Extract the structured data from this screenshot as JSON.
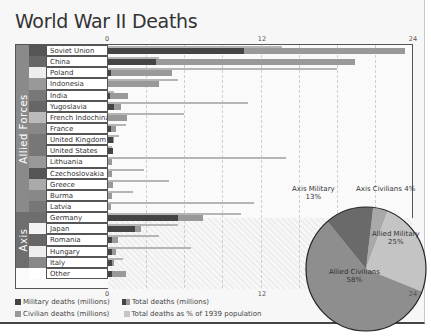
{
  "title": "World War II Deaths",
  "axis": {
    "ticks": [
      "0",
      "12",
      "24"
    ]
  },
  "groups": [
    {
      "label": "Allied Forces",
      "color": "#8a8a8a"
    },
    {
      "label": "Axis",
      "color": "#6e6e6e"
    }
  ],
  "legend": {
    "military": "Military deaths (millions)",
    "total": "Total deaths (millions)",
    "civilian": "Civilian deaths (millions)",
    "pct": "Total deaths as % of 1939 population"
  },
  "pie": {
    "slices": [
      {
        "label": "Axis Civilians",
        "pct": "4%",
        "value": 4,
        "color": "#a9a9a9"
      },
      {
        "label": "Allied Military",
        "pct": "25%",
        "value": 25,
        "color": "#c4c4c4"
      },
      {
        "label": "Allied Civilians",
        "pct": "58%",
        "value": 58,
        "color": "#8e8e8e"
      },
      {
        "label": "Axis Military",
        "pct": "13%",
        "value": 13,
        "color": "#6a6a6a"
      }
    ]
  },
  "rows": [
    {
      "name": "Soviet Union",
      "group": "Allied Forces",
      "military": 10.7,
      "total": 23.4,
      "pct": 13.7
    },
    {
      "name": "China",
      "group": "Allied Forces",
      "military": 3.8,
      "total": 19.4,
      "pct": 4.0
    },
    {
      "name": "Poland",
      "group": "Allied Forces",
      "military": 0.2,
      "total": 5.0,
      "pct": 18.0
    },
    {
      "name": "Indonesia",
      "group": "Allied Forces",
      "military": 0,
      "total": 4.0,
      "pct": 5.5
    },
    {
      "name": "India",
      "group": "Allied Forces",
      "military": 0.1,
      "total": 1.6,
      "pct": 0.5
    },
    {
      "name": "Yugoslavia",
      "group": "Allied Forces",
      "military": 0.5,
      "total": 1.0,
      "pct": 11.0
    },
    {
      "name": "French Indochina",
      "group": "Allied Forces",
      "military": 0,
      "total": 1.5,
      "pct": 6.0
    },
    {
      "name": "France",
      "group": "Allied Forces",
      "military": 0.2,
      "total": 0.6,
      "pct": 1.4
    },
    {
      "name": "United Kingdom",
      "group": "Allied Forces",
      "military": 0.4,
      "total": 0.5,
      "pct": 0.9
    },
    {
      "name": "United States",
      "group": "Allied Forces",
      "military": 0.4,
      "total": 0.4,
      "pct": 0.3
    },
    {
      "name": "Lithuania",
      "group": "Allied Forces",
      "military": 0,
      "total": 0.3,
      "pct": 14.0
    },
    {
      "name": "Czechoslovakia",
      "group": "Allied Forces",
      "military": 0,
      "total": 0.3,
      "pct": 2.8
    },
    {
      "name": "Greece",
      "group": "Allied Forces",
      "military": 0,
      "total": 0.4,
      "pct": 4.8
    },
    {
      "name": "Burma",
      "group": "Allied Forces",
      "military": 0,
      "total": 0.3,
      "pct": 2.0
    },
    {
      "name": "Latvia",
      "group": "Allied Forces",
      "military": 0,
      "total": 0.2,
      "pct": 11.5
    },
    {
      "name": "Germany",
      "group": "Axis",
      "military": 5.5,
      "total": 7.5,
      "pct": 10.5
    },
    {
      "name": "Japan",
      "group": "Axis",
      "military": 2.1,
      "total": 2.6,
      "pct": 5.5
    },
    {
      "name": "Romania",
      "group": "Axis",
      "military": 0.3,
      "total": 0.8,
      "pct": 4.0
    },
    {
      "name": "Hungary",
      "group": "Axis",
      "military": 0.3,
      "total": 0.6,
      "pct": 6.5
    },
    {
      "name": "Italy",
      "group": "Axis",
      "military": 0.3,
      "total": 0.5,
      "pct": 1.2
    },
    {
      "name": "Other",
      "group": "",
      "military": 0.3,
      "total": 1.4,
      "pct": 0
    }
  ],
  "chart_data": [
    {
      "type": "bar",
      "title": "World War II Deaths",
      "orientation": "horizontal",
      "categories": [
        "Soviet Union",
        "China",
        "Poland",
        "Indonesia",
        "India",
        "Yugoslavia",
        "French Indochina",
        "France",
        "United Kingdom",
        "United States",
        "Lithuania",
        "Czechoslovakia",
        "Greece",
        "Burma",
        "Latvia",
        "Germany",
        "Japan",
        "Romania",
        "Hungary",
        "Italy",
        "Other"
      ],
      "series": [
        {
          "name": "Military deaths (millions)",
          "values": [
            10.7,
            3.8,
            0.2,
            0,
            0.1,
            0.5,
            0,
            0.2,
            0.4,
            0.4,
            0,
            0,
            0,
            0,
            0,
            5.5,
            2.1,
            0.3,
            0.3,
            0.3,
            0.3
          ]
        },
        {
          "name": "Total deaths (millions)",
          "values": [
            23.4,
            19.4,
            5.0,
            4.0,
            1.6,
            1.0,
            1.5,
            0.6,
            0.5,
            0.4,
            0.3,
            0.3,
            0.4,
            0.3,
            0.2,
            7.5,
            2.6,
            0.8,
            0.6,
            0.5,
            1.4
          ]
        },
        {
          "name": "Total deaths as % of 1939 population",
          "values": [
            13.7,
            4.0,
            18.0,
            5.5,
            0.5,
            11.0,
            6.0,
            1.4,
            0.9,
            0.3,
            14.0,
            2.8,
            4.8,
            2.0,
            11.5,
            10.5,
            5.5,
            4.0,
            6.5,
            1.2,
            0
          ]
        }
      ],
      "group_labels": [
        "Allied Forces",
        "Axis"
      ],
      "xlim": [
        0,
        24
      ],
      "xticks": [
        0,
        12,
        24
      ],
      "grid": true,
      "legend_position": "bottom"
    },
    {
      "type": "pie",
      "categories": [
        "Axis Civilians",
        "Allied Military",
        "Allied Civilians",
        "Axis Military"
      ],
      "values": [
        4,
        25,
        58,
        13
      ]
    }
  ]
}
